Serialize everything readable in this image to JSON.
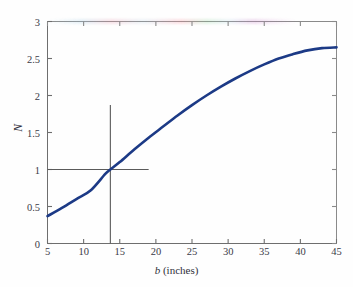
{
  "figure": {
    "background_color": "#fefefe",
    "axis_color": "#6e6e6e",
    "curve_color": "#1c3a86",
    "guide_color": "#5a5a5a"
  },
  "axis_titles": {
    "x_variable": "b",
    "x_unit": "(inches)",
    "y": "N"
  },
  "chart_data": {
    "type": "line",
    "title": "",
    "xlabel": "b (inches)",
    "ylabel": "N",
    "xlim": [
      5,
      45
    ],
    "ylim": [
      0,
      3
    ],
    "grid": false,
    "legend": null,
    "xticks": [
      5,
      10,
      15,
      20,
      25,
      30,
      35,
      40,
      45
    ],
    "xtick_labels": [
      "5",
      "10",
      "15",
      "20",
      "25",
      "30",
      "35",
      "40",
      "45"
    ],
    "yticks": [
      0,
      0.5,
      1,
      1.5,
      2,
      2.5,
      3
    ],
    "ytick_labels": [
      "0",
      "0.5",
      "1",
      "1.5",
      "2",
      "2.5",
      "3"
    ],
    "series": [
      {
        "name": "N vs b",
        "color": "#1c3a86",
        "line_width": 2.6,
        "x": [
          5,
          7,
          9,
          11,
          13,
          13.7,
          15,
          17,
          19,
          21,
          23,
          25,
          27,
          29,
          31,
          33,
          35,
          37,
          39,
          41,
          43,
          45
        ],
        "y": [
          0.37,
          0.48,
          0.6,
          0.72,
          0.94,
          1.0,
          1.1,
          1.27,
          1.43,
          1.58,
          1.73,
          1.87,
          2.0,
          2.12,
          2.23,
          2.33,
          2.42,
          2.5,
          2.56,
          2.61,
          2.64,
          2.65
        ]
      }
    ],
    "annotations": [
      {
        "name": "crosshair",
        "type": "guide-lines",
        "x": 13.7,
        "y": 1,
        "vertical_line_top_y": 1.87,
        "horizontal_line_right_x": 19,
        "label": ""
      }
    ]
  }
}
